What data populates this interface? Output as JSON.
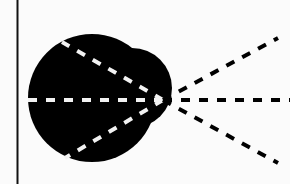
{
  "figure": {
    "background": "#fbfbfb",
    "ink_color": "#000000",
    "highlight_color": "#f2f2f2",
    "axis_line": {
      "x": 17.5,
      "y1": 0,
      "y2": 184
    },
    "shape": {
      "description": "dark blob with larger round lobe on left and smaller bump on upper right",
      "main_circle": {
        "cx": 92,
        "cy": 98,
        "r": 64
      },
      "bump_circle": {
        "cx": 132,
        "cy": 88,
        "r": 40
      }
    },
    "origin": {
      "x": 163,
      "y": 100
    },
    "white_dashed_rays": [
      {
        "x2": 62,
        "y2": 42
      },
      {
        "x2": 27,
        "y2": 100
      },
      {
        "x2": 65,
        "y2": 158
      }
    ],
    "black_dashed_rays": [
      {
        "x2": 278,
        "y2": 38
      },
      {
        "x2": 290,
        "y2": 100
      },
      {
        "x2": 278,
        "y2": 163
      }
    ]
  }
}
